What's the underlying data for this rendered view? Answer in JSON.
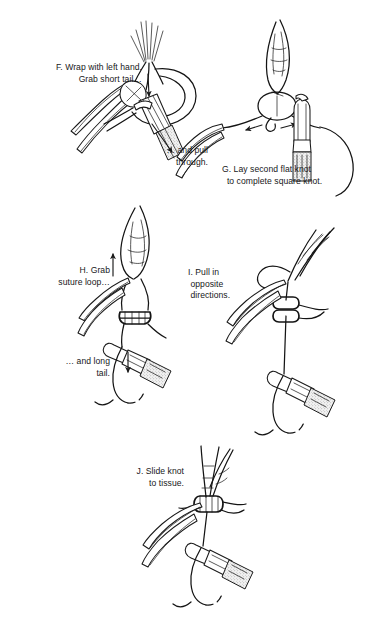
{
  "document": {
    "type": "surgical-illustration",
    "title": "Instrument tie — square knot completion sequence",
    "background_color": "#ffffff",
    "ink_color": "#1a1a1a",
    "shade_color": "#b8b8b8"
  },
  "panels": [
    {
      "id": "F",
      "captions": [
        {
          "name": "caption-f-main",
          "text": "F. Wrap with left hand.\n  Grab short tail…",
          "align": "right"
        },
        {
          "name": "caption-f-pull",
          "text": "… and pull\nthrough.",
          "align": "right"
        }
      ],
      "elements": [
        "tissue-wound-edges",
        "needle-holder-left",
        "forceps-right",
        "suture-loop-wrap",
        "short-tail",
        "pull-through-arrow"
      ]
    },
    {
      "id": "G",
      "captions": [
        {
          "name": "caption-g-main",
          "text": "G. Lay second flat knot\n  to complete square knot.",
          "align": "left"
        }
      ],
      "elements": [
        "first-throw-knot",
        "second-flat-loop",
        "needle-holder-left",
        "needle-holder-right",
        "tension-arrow-left",
        "tension-arrow-right",
        "long-suture-tail"
      ]
    },
    {
      "id": "H",
      "captions": [
        {
          "name": "caption-h-main",
          "text": "H. Grab\n suture loop…",
          "align": "right"
        },
        {
          "name": "caption-h-tail",
          "text": "… and long\n  tail.",
          "align": "right"
        }
      ],
      "elements": [
        "suture-loop",
        "square-knot",
        "forceps-left",
        "needle-holder-right",
        "up-arrow",
        "down-arrow",
        "curved-needle"
      ]
    },
    {
      "id": "I",
      "captions": [
        {
          "name": "caption-i-main",
          "text": "I. Pull in\n opposite\n directions.",
          "align": "right"
        }
      ],
      "elements": [
        "tightened-knot",
        "forceps-left",
        "needle-holder-right",
        "suture-strand",
        "curved-needle"
      ]
    },
    {
      "id": "J",
      "captions": [
        {
          "name": "caption-j-main",
          "text": "J. Slide knot\n to tissue.",
          "align": "right"
        }
      ],
      "elements": [
        "slid-knot",
        "forceps-left",
        "needle-holder-right",
        "suture-strand",
        "curved-needle"
      ]
    }
  ]
}
